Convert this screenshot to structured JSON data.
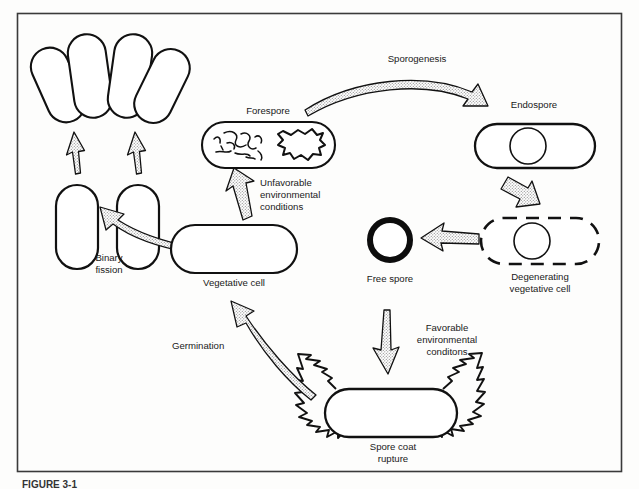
{
  "figure": {
    "background_color": "#fdfdfc",
    "frame_color": "#3a3a3a",
    "ink_color": "#111111",
    "stipple_color": "#a9a9a9",
    "caption_partial": "FIGURE 3-1"
  },
  "labels": {
    "sporogenesis": "Sporogenesis",
    "forespore": "Forespore",
    "endospore": "Endospore",
    "unfavorable": "Unfavorable\nenvironmental\nconditions",
    "unfavorable_line1": "Unfavorable",
    "unfavorable_line2": "environmental",
    "unfavorable_line3": "conditions",
    "binary_fission_line1": "Binary",
    "binary_fission_line2": "fission",
    "vegetative_cell": "Vegetative cell",
    "free_spore": "Free spore",
    "degenerating_line1": "Degenerating",
    "degenerating_line2": "vegetative cell",
    "germination": "Germination",
    "favorable_line1": "Favorable",
    "favorable_line2": "environmental",
    "favorable_line3": "conditons",
    "spore_coat_line1": "Spore coat",
    "spore_coat_line2": "rupture"
  },
  "nodes": [
    {
      "id": "daughter-cells-top",
      "kind": "capsule-group",
      "count": 4,
      "label": ""
    },
    {
      "id": "dividing-cells",
      "kind": "capsule-group",
      "count": 2,
      "label": ""
    },
    {
      "id": "vegetative-cell",
      "kind": "capsule",
      "label": "Vegetative cell"
    },
    {
      "id": "forespore-cell",
      "kind": "capsule-with-dna-and-blob",
      "label": "Forespore"
    },
    {
      "id": "endospore-cell",
      "kind": "capsule-with-circle",
      "label": "Endospore"
    },
    {
      "id": "degenerating-cell",
      "kind": "dashed-capsule-with-circle",
      "label": "Degenerating vegetative cell"
    },
    {
      "id": "free-spore",
      "kind": "thick-ring",
      "label": "Free spore"
    },
    {
      "id": "spore-coat-rupture",
      "kind": "capsule-with-spikes",
      "label": "Spore coat rupture"
    }
  ],
  "arrows": [
    {
      "id": "arrow-sporogenesis",
      "from": "forespore-cell",
      "to": "endospore-cell",
      "label": "Sporogenesis",
      "style": "curved-stippled"
    },
    {
      "id": "arrow-unfavorable",
      "from": "vegetative-cell",
      "to": "forespore-cell",
      "label": "Unfavorable environmental conditions",
      "style": "straight-stippled"
    },
    {
      "id": "arrow-endospore-release",
      "from": "endospore-cell",
      "to": "degenerating-cell",
      "label": "",
      "style": "straight-stippled"
    },
    {
      "id": "arrow-spore-release",
      "from": "degenerating-cell",
      "to": "free-spore",
      "label": "",
      "style": "straight-stippled"
    },
    {
      "id": "arrow-favorable",
      "from": "free-spore",
      "to": "spore-coat-rupture",
      "label": "Favorable environmental conditons",
      "style": "straight-stippled"
    },
    {
      "id": "arrow-germination",
      "from": "spore-coat-rupture",
      "to": "vegetative-cell",
      "label": "Germination",
      "style": "curved-stippled"
    },
    {
      "id": "arrow-binary-fission",
      "from": "vegetative-cell",
      "to": "dividing-cells",
      "label": "Binary fission",
      "style": "curved-stippled"
    },
    {
      "id": "arrow-division-left",
      "from": "dividing-cells",
      "to": "daughter-cells-top",
      "label": "",
      "style": "straight-stippled"
    },
    {
      "id": "arrow-division-right",
      "from": "dividing-cells",
      "to": "daughter-cells-top",
      "label": "",
      "style": "straight-stippled"
    }
  ]
}
